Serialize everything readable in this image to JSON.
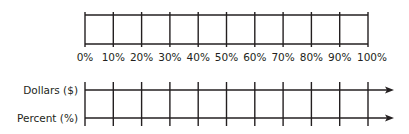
{
  "percent_bar": {
    "tick_labels": [
      "0%",
      "10%",
      "20%",
      "30%",
      "40%",
      "50%",
      "60%",
      "70%",
      "80%",
      "90%",
      "100%"
    ]
  },
  "double_number_line": {
    "rows": [
      {
        "label": "Dollars ($)"
      },
      {
        "label": "Percent (%)"
      }
    ],
    "tick_count": 11
  },
  "colors": {
    "ink": "#231f20",
    "background": "#ffffff"
  }
}
